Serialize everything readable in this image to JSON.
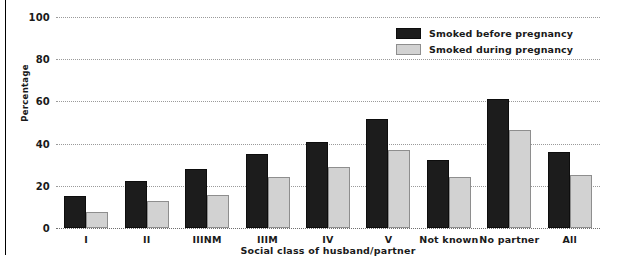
{
  "chart_data": {
    "type": "bar",
    "title": "",
    "xlabel": "Social class of husband/partner",
    "ylabel": "Percentage",
    "ylim": [
      0,
      100
    ],
    "yticks": [
      0,
      20,
      40,
      60,
      80,
      100
    ],
    "ytick_labels": [
      "0",
      "20",
      "40",
      "60",
      "80",
      "100"
    ],
    "grid": true,
    "legend_position": "top-right",
    "categories": [
      "I",
      "II",
      "IIINM",
      "IIIM",
      "IV",
      "V",
      "Not known",
      "No partner",
      "All"
    ],
    "series": [
      {
        "name": "Smoked before pregnancy",
        "color": "#1c1c1c",
        "values": [
          15,
          22.5,
          28,
          35,
          41,
          51.5,
          32,
          61,
          36
        ]
      },
      {
        "name": "Smoked during pregnancy",
        "color": "#d2d2d2",
        "values": [
          7.5,
          13,
          15.5,
          24,
          29,
          37,
          24,
          46.5,
          25
        ]
      }
    ]
  }
}
